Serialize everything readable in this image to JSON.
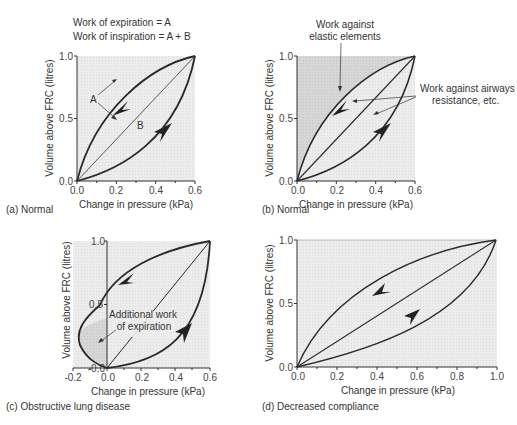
{
  "header": {
    "line1": "Work of expiration = A",
    "line2": "Work of inspiration = A + B"
  },
  "colors": {
    "plot_fill": "#eaeaea",
    "dark_fill": "#d4d4d4",
    "curve": "#2a2a2a"
  },
  "panels": [
    {
      "id": "a",
      "caption": "(a) Normal",
      "xlabel": "Change in pressure (kPa)",
      "ylabel": "Volume above FRC (litres)",
      "xticks": [
        "0.0",
        "0.2",
        "0.4",
        "0.6"
      ],
      "yticks": [
        "0.0",
        "0.5",
        "1.0"
      ],
      "labels": {
        "A": "A",
        "B": "B"
      }
    },
    {
      "id": "b",
      "caption": "(b) Normal",
      "xlabel": "Change in pressure (kPa)",
      "ylabel": "Volume above FRC (litres)",
      "xticks": [
        "0.0",
        "0.2",
        "0.4",
        "0.6"
      ],
      "yticks": [
        "0.0",
        "0.5",
        "1.0"
      ],
      "annotations": {
        "elastic_line1": "Work against",
        "elastic_line2": "elastic elements",
        "airway_line1": "Work against airways",
        "airway_line2": "resistance, etc."
      }
    },
    {
      "id": "c",
      "caption": "(c)  Obstructive lung disease",
      "xlabel": "Change in pressure (kPa)",
      "ylabel": "Volume above FRC (litres)",
      "xticks": [
        "-0.2",
        "0.0",
        "0.2",
        "0.4",
        "0.6"
      ],
      "yticks": [
        "-0.0",
        "0.5",
        "1.0"
      ],
      "annotations": {
        "line1": "Additional work",
        "line2": "of expiration"
      }
    },
    {
      "id": "d",
      "caption": "(d)    Decreased compliance",
      "xlabel": "Change in pressure (kPa)",
      "ylabel": "Volume above FRC (litres)",
      "xticks": [
        "0.0",
        "0.2",
        "0.4",
        "0.6",
        "0.8",
        "1.0"
      ],
      "yticks": [
        "0.0",
        "0.5",
        "1.0"
      ]
    }
  ]
}
